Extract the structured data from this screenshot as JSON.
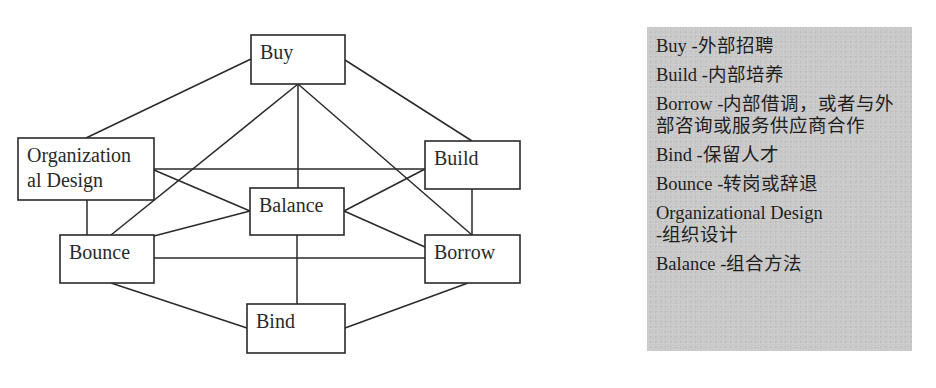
{
  "diagram": {
    "nodes": [
      {
        "id": "buy",
        "label_lines": [
          "Buy"
        ]
      },
      {
        "id": "organizational-design",
        "label_lines": [
          "Organization",
          "al Design"
        ]
      },
      {
        "id": "build",
        "label_lines": [
          "Build"
        ]
      },
      {
        "id": "balance",
        "label_lines": [
          "Balance"
        ]
      },
      {
        "id": "bounce",
        "label_lines": [
          "Bounce"
        ]
      },
      {
        "id": "borrow",
        "label_lines": [
          "Borrow"
        ]
      },
      {
        "id": "bind",
        "label_lines": [
          "Bind"
        ]
      }
    ],
    "edges": [
      [
        "buy",
        "organizational-design"
      ],
      [
        "buy",
        "build"
      ],
      [
        "buy",
        "bounce"
      ],
      [
        "buy",
        "balance"
      ],
      [
        "buy",
        "borrow"
      ],
      [
        "organizational-design",
        "build"
      ],
      [
        "organizational-design",
        "balance"
      ],
      [
        "organizational-design",
        "bounce"
      ],
      [
        "build",
        "balance"
      ],
      [
        "build",
        "borrow"
      ],
      [
        "balance",
        "bounce"
      ],
      [
        "balance",
        "borrow"
      ],
      [
        "balance",
        "bind"
      ],
      [
        "bounce",
        "borrow"
      ],
      [
        "bounce",
        "bind"
      ],
      [
        "borrow",
        "bind"
      ]
    ]
  },
  "legend": {
    "items": [
      {
        "term": "Buy",
        "separator": " -",
        "meaning": "外部招聘"
      },
      {
        "term": "Build",
        "separator": " -",
        "meaning": "内部培养"
      },
      {
        "term": "Borrow",
        "separator": " -",
        "meaning": "内部借调，或者与外部咨询或服务供应商合作"
      },
      {
        "term": "Bind",
        "separator": " -",
        "meaning": "保留人才"
      },
      {
        "term": "Bounce",
        "separator": " -",
        "meaning": "转岗或辞退"
      },
      {
        "term": "Organizational Design",
        "separator": " -",
        "meaning": "组织设计"
      },
      {
        "term": "Balance",
        "separator": " -",
        "meaning": "组合方法"
      }
    ]
  }
}
